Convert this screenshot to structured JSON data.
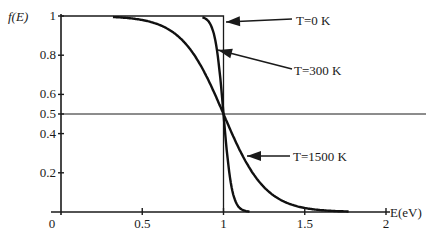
{
  "chart_data": {
    "type": "line",
    "title": "",
    "xlabel": "E(eV)",
    "ylabel": "f(E)",
    "xlim": [
      0,
      2
    ],
    "ylim": [
      0,
      1
    ],
    "x_ticks": [
      0,
      0.5,
      1,
      1.5,
      2
    ],
    "x_tick_labels": [
      "0",
      "0.5",
      "1",
      "1.5",
      "2"
    ],
    "y_ticks": [
      0.2,
      0.4,
      0.5,
      0.6,
      0.8,
      1
    ],
    "y_tick_labels": [
      "0.2",
      "0.4",
      "0.5",
      "0.6",
      "0.8",
      "1"
    ],
    "grid": false,
    "reference_lines": [
      {
        "orientation": "horizontal",
        "y": 0.5
      },
      {
        "orientation": "vertical",
        "x": 1
      }
    ],
    "fermi_energy_eV": 1.0,
    "series": [
      {
        "name": "T=0 K",
        "x": [
          0,
          1,
          1,
          2
        ],
        "values": [
          1,
          1,
          0,
          0
        ]
      },
      {
        "name": "T=300 K",
        "x": [
          0.8,
          0.85,
          0.9,
          0.95,
          0.98,
          1.0,
          1.02,
          1.05,
          1.1,
          1.15,
          1.2
        ],
        "values": [
          1.0,
          1.0,
          0.98,
          0.87,
          0.68,
          0.5,
          0.32,
          0.13,
          0.02,
          0.003,
          0.0
        ]
      },
      {
        "name": "T=1500 K",
        "x": [
          0.3,
          0.4,
          0.5,
          0.6,
          0.7,
          0.8,
          0.9,
          1.0,
          1.1,
          1.2,
          1.3,
          1.4,
          1.5,
          1.6,
          1.7,
          1.75
        ],
        "values": [
          1.0,
          0.99,
          0.98,
          0.96,
          0.91,
          0.83,
          0.69,
          0.5,
          0.31,
          0.17,
          0.085,
          0.04,
          0.02,
          0.01,
          0.004,
          0.003
        ]
      }
    ],
    "annotations": [
      {
        "text": "T=0 K",
        "points_to": "T=0 K curve at E=1, f=1"
      },
      {
        "text": "T=300 K",
        "points_to": "T=300 K curve near f≈0.8"
      },
      {
        "text": "T=1500 K",
        "points_to": "T=1500 K curve near E≈1.1"
      }
    ]
  },
  "labels": {
    "ylabel": "f(E)",
    "xlabel": "E(eV)",
    "ann_t0": "T=0 K",
    "ann_t300": "T=300 K",
    "ann_t1500": "T=1500 K"
  }
}
